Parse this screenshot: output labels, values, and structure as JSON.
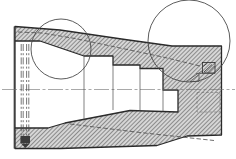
{
  "canvas": {
    "width": 236,
    "height": 159,
    "background": "#ffffff"
  },
  "palette": {
    "line_dark": "#2a2a2a",
    "line_medium": "#4a4a4a",
    "line_thin": "#6f6f6f",
    "hatch_line": "#8b8b8b",
    "hatch_bg": "#d6d6d6"
  },
  "drawing": {
    "shapes": [
      {
        "type": "path",
        "name": "section-body",
        "cls": "body-hatch",
        "attrs": {
          "d": "M15,26.5 L60,30 L125,39.5 L172,46 L221.5,46 L221.5,135 L187,136 L157,145.5 L60,148.5 L15,148.5 Z M15,41 L40,41 L84,56 L113,56 L113,65 L140,65 L140,68.5 L163,68.5 L163,90 L178,90 L178,112 L130,110.5 L65,123 L48,128 L15,128 Z"
        }
      },
      {
        "type": "line",
        "name": "left-end-face-edge",
        "cls": "edge",
        "attrs": {
          "x1": 14.2,
          "y1": 26.5,
          "x2": 14.2,
          "y2": 148.5
        }
      },
      {
        "type": "line",
        "name": "centerline",
        "cls": "centerline",
        "attrs": {
          "x1": 2,
          "y1": 89.5,
          "x2": 235,
          "y2": 89.5
        }
      },
      {
        "type": "line",
        "name": "bore-step-line-1",
        "cls": "thin",
        "attrs": {
          "x1": 84,
          "y1": 56,
          "x2": 84,
          "y2": 120.5
        }
      },
      {
        "type": "line",
        "name": "bore-step-line-2",
        "cls": "thin",
        "attrs": {
          "x1": 113,
          "y1": 65,
          "x2": 113,
          "y2": 110
        }
      },
      {
        "type": "line",
        "name": "bore-step-line-3",
        "cls": "thin",
        "attrs": {
          "x1": 140,
          "y1": 68.5,
          "x2": 140,
          "y2": 110.5
        }
      },
      {
        "type": "line",
        "name": "bore-step-line-4",
        "cls": "thin",
        "attrs": {
          "x1": 163,
          "y1": 90,
          "x2": 163,
          "y2": 111
        }
      },
      {
        "type": "line",
        "name": "hidden-hole-line-1",
        "cls": "hidden-line",
        "attrs": {
          "x1": 21.2,
          "y1": 44,
          "x2": 21.2,
          "y2": 144
        }
      },
      {
        "type": "line",
        "name": "hidden-hole-line-2",
        "cls": "hidden-line",
        "attrs": {
          "x1": 23.2,
          "y1": 44,
          "x2": 23.2,
          "y2": 144
        }
      },
      {
        "type": "line",
        "name": "hidden-hole-line-3",
        "cls": "hidden-line",
        "attrs": {
          "x1": 26.6,
          "y1": 44,
          "x2": 26.6,
          "y2": 144
        }
      },
      {
        "type": "line",
        "name": "hidden-hole-line-4",
        "cls": "hidden-line",
        "attrs": {
          "x1": 28.8,
          "y1": 44,
          "x2": 28.8,
          "y2": 144
        }
      },
      {
        "type": "rect",
        "name": "hole-bottom-fill",
        "cls": "dark-fill",
        "attrs": {
          "x": 20.5,
          "y": 136,
          "width": 9.5,
          "height": 7
        }
      },
      {
        "type": "polygon",
        "name": "hole-bottom-point",
        "cls": "dark-fill",
        "attrs": {
          "points": "21,143.5 30,143.5 25.4,148"
        }
      },
      {
        "type": "polyline",
        "name": "phantom-contour-top",
        "cls": "phantom",
        "attrs": {
          "points": "18,32 42,33 75,38.5 113,46.5 165,57.5 202,66.5"
        }
      },
      {
        "type": "polyline",
        "name": "phantom-contour-bottom",
        "cls": "phantom",
        "attrs": {
          "points": "70,124 140,132.5 214,140.5"
        }
      },
      {
        "type": "rect",
        "name": "hidden-groove-rect",
        "cls": "dashed-thin",
        "attrs": {
          "x": 197,
          "y": 92.5,
          "width": 23,
          "height": 19.5
        }
      },
      {
        "type": "rect",
        "name": "groove-detail-rect",
        "cls": "thin-dark",
        "attrs": {
          "x": 202.5,
          "y": 62.5,
          "width": 12.5,
          "height": 10.5
        }
      },
      {
        "type": "line",
        "name": "groove-hatch-mark-1",
        "cls": "thin-dark",
        "attrs": {
          "x1": 204,
          "y1": 72,
          "x2": 212,
          "y2": 64.5
        }
      },
      {
        "type": "line",
        "name": "groove-hatch-mark-2",
        "cls": "thin-dark",
        "attrs": {
          "x1": 207.5,
          "y1": 73,
          "x2": 214.5,
          "y2": 66
        }
      },
      {
        "type": "line",
        "name": "groove-hatch-mark-3",
        "cls": "thin-dark",
        "attrs": {
          "x1": 203,
          "y1": 66.5,
          "x2": 207.5,
          "y2": 63
        }
      },
      {
        "type": "line",
        "name": "groove-leader-line",
        "cls": "thin",
        "attrs": {
          "x1": 186,
          "y1": 81.5,
          "x2": 202.5,
          "y2": 70.5
        }
      },
      {
        "type": "line",
        "name": "groove-shelf-line",
        "cls": "thin",
        "attrs": {
          "x1": 196,
          "y1": 73.5,
          "x2": 215,
          "y2": 73.5
        }
      },
      {
        "type": "polyline",
        "name": "chamfer-triangle",
        "cls": "thin",
        "attrs": {
          "points": "190,81.5 199,81.5 199,74.5 190,81.5"
        }
      },
      {
        "type": "circle",
        "name": "detail-callout-circle-left",
        "cls": "callout",
        "attrs": {
          "cx": 61,
          "cy": 49,
          "r": 30
        }
      },
      {
        "type": "circle",
        "name": "detail-callout-circle-right",
        "cls": "callout",
        "attrs": {
          "cx": 189,
          "cy": 41,
          "r": 41
        }
      }
    ]
  }
}
